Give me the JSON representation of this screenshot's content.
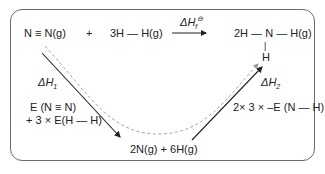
{
  "diagram": {
    "type": "Hess cycle / enthalpy cycle",
    "reactants": {
      "n2": "N ≡ N(g)",
      "plus": "+",
      "h2": "3H — H(g)"
    },
    "top_arrow_label": {
      "delta": "ΔH",
      "sub": "f",
      "sup": "⊖"
    },
    "product": {
      "row": "2H — N — H(g)",
      "bond": "|",
      "h": "H"
    },
    "intermediate": "2N(g) + 6H(g)",
    "left_path": {
      "label": {
        "delta": "ΔH",
        "sub": "1"
      },
      "energy_line1": "E (N ≡ N)",
      "energy_line2": "+ 3 × E(H — H)"
    },
    "right_path": {
      "label": {
        "delta": "ΔH",
        "sub": "2"
      },
      "energy": "2× 3 × –E (N — H)"
    },
    "colors": {
      "frame": "#6b6b6b",
      "arrow": "#222222",
      "dashed": "#9a9a9a"
    }
  }
}
